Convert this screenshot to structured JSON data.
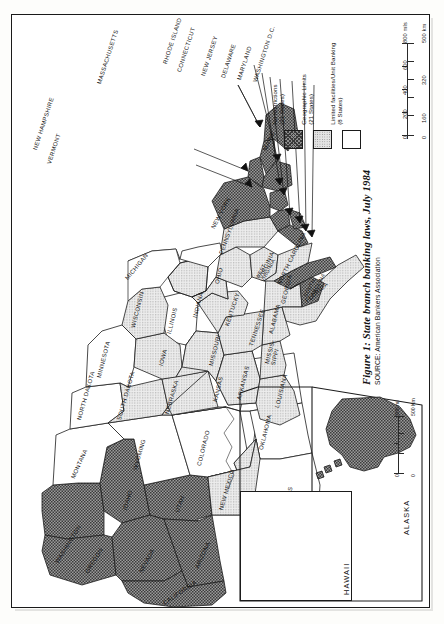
{
  "figure": {
    "title": "Figure 1: State branch banking laws, July 1984",
    "source": "SOURCE: American Bankers Association"
  },
  "legend": {
    "title": "",
    "items": [
      {
        "pattern": "dark-hatch",
        "label_line1": "No restrictions",
        "label_line2": "(21 States)"
      },
      {
        "pattern": "light-stipple",
        "label_line1": "Geographic Limits",
        "label_line2": "(21 States)"
      },
      {
        "pattern": "white",
        "label_line1": "Limited facilities/Unit Banking",
        "label_line2": "(8 States)"
      }
    ]
  },
  "scale_bar": {
    "miles_unit": "800 mls",
    "km_unit": "500 km",
    "miles_ticks": [
      "0",
      "200",
      "400",
      "600",
      "800"
    ],
    "km_ticks": [
      "0",
      "160",
      "320",
      "500"
    ]
  },
  "inset_scale_bar": {
    "miles_unit": "300 mi",
    "km_unit": "500 Km",
    "miles_ticks": [
      "0",
      "300"
    ],
    "km_ticks": [
      "0",
      "500"
    ]
  },
  "insets": {
    "alaska_label": "ALASKA",
    "hawaii_label": "HAWAII"
  },
  "map_data": {
    "type": "choropleth",
    "categories": [
      {
        "key": "none",
        "name": "No restrictions",
        "states_count": 21,
        "pattern": "dark-hatch"
      },
      {
        "key": "geo",
        "name": "Geographic Limits",
        "states_count": 21,
        "pattern": "light-stipple"
      },
      {
        "key": "limited",
        "name": "Limited facilities/Unit Banking",
        "states_count": 8,
        "pattern": "white"
      }
    ],
    "states": [
      {
        "label": "MAINE",
        "category": "none"
      },
      {
        "label": "NEW HAMPSHIRE",
        "category": "none"
      },
      {
        "label": "VERMONT",
        "category": "none"
      },
      {
        "label": "MASSACHUSETTS",
        "category": "none"
      },
      {
        "label": "RHODE ISLAND",
        "category": "none"
      },
      {
        "label": "CONNECTICUT",
        "category": "none"
      },
      {
        "label": "NEW YORK",
        "category": "none"
      },
      {
        "label": "NEW JERSEY",
        "category": "none"
      },
      {
        "label": "PENNSYLVANIA",
        "category": "geo"
      },
      {
        "label": "DELAWARE",
        "category": "none"
      },
      {
        "label": "MARYLAND",
        "category": "none"
      },
      {
        "label": "WASHINGTON D.C.",
        "category": "none"
      },
      {
        "label": "WEST VIRGINIA",
        "category": "geo"
      },
      {
        "label": "VIRGINIA",
        "category": "geo"
      },
      {
        "label": "NORTH CAROLINA",
        "category": "none"
      },
      {
        "label": "SOUTH CAROLINA",
        "category": "none"
      },
      {
        "label": "GEORGIA",
        "category": "geo"
      },
      {
        "label": "FLORIDA",
        "category": "geo"
      },
      {
        "label": "ALABAMA",
        "category": "geo"
      },
      {
        "label": "MISSIS-SIPPI",
        "category": "geo"
      },
      {
        "label": "TENNESSEE",
        "category": "geo"
      },
      {
        "label": "KENTUCKY",
        "category": "geo"
      },
      {
        "label": "OHIO",
        "category": "geo"
      },
      {
        "label": "INDIANA",
        "category": "geo"
      },
      {
        "label": "ILLINOIS",
        "category": "limited"
      },
      {
        "label": "MICHIGAN",
        "category": "geo"
      },
      {
        "label": "WISCONSIN",
        "category": "geo"
      },
      {
        "label": "MINNESOTA",
        "category": "limited"
      },
      {
        "label": "IOWA",
        "category": "geo"
      },
      {
        "label": "MISSOURI",
        "category": "geo"
      },
      {
        "label": "ARKANSAS",
        "category": "geo"
      },
      {
        "label": "LOUISIANA",
        "category": "geo"
      },
      {
        "label": "TEXAS",
        "category": "limited"
      },
      {
        "label": "OKLAHOMA",
        "category": "limited"
      },
      {
        "label": "KANSAS",
        "category": "limited"
      },
      {
        "label": "NEBRASKA",
        "category": "geo"
      },
      {
        "label": "SOUTH DAKOTA",
        "category": "geo"
      },
      {
        "label": "NORTH DAKOTA",
        "category": "limited"
      },
      {
        "label": "MONTANA",
        "category": "limited"
      },
      {
        "label": "WYOMING",
        "category": "limited"
      },
      {
        "label": "COLORADO",
        "category": "limited"
      },
      {
        "label": "NEW MEXICO",
        "category": "geo"
      },
      {
        "label": "ARIZONA",
        "category": "none"
      },
      {
        "label": "UTAH",
        "category": "none"
      },
      {
        "label": "NEVADA",
        "category": "none"
      },
      {
        "label": "IDAHO",
        "category": "none"
      },
      {
        "label": "WASHINGTON",
        "category": "none"
      },
      {
        "label": "OREGON",
        "category": "none"
      },
      {
        "label": "CALIFORNIA",
        "category": "none"
      },
      {
        "label": "ALASKA",
        "category": "none"
      },
      {
        "label": "HAWAII",
        "category": "none"
      }
    ]
  }
}
